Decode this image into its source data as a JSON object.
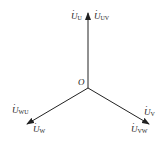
{
  "diagram": {
    "type": "phasor-diagram",
    "origin": {
      "label": "O",
      "x": 88,
      "y": 88
    },
    "line_color": "#222222",
    "phasors": [
      {
        "id": "up",
        "tip": [
          88,
          13
        ],
        "labels": [
          {
            "base": "U",
            "sub": "U",
            "x": 71,
            "y": 12
          },
          {
            "base": "U",
            "sub": "UV",
            "x": 94,
            "y": 12
          }
        ]
      },
      {
        "id": "down-left",
        "tip": [
          27,
          124
        ],
        "labels": [
          {
            "base": "U",
            "sub": "WU",
            "x": 12,
            "y": 106
          },
          {
            "base": "U",
            "sub": "W",
            "x": 33,
            "y": 125
          }
        ]
      },
      {
        "id": "down-right",
        "tip": [
          149,
          124
        ],
        "labels": [
          {
            "base": "U",
            "sub": "V",
            "x": 144,
            "y": 108
          },
          {
            "base": "U",
            "sub": "VW",
            "x": 131,
            "y": 125
          }
        ]
      }
    ]
  }
}
